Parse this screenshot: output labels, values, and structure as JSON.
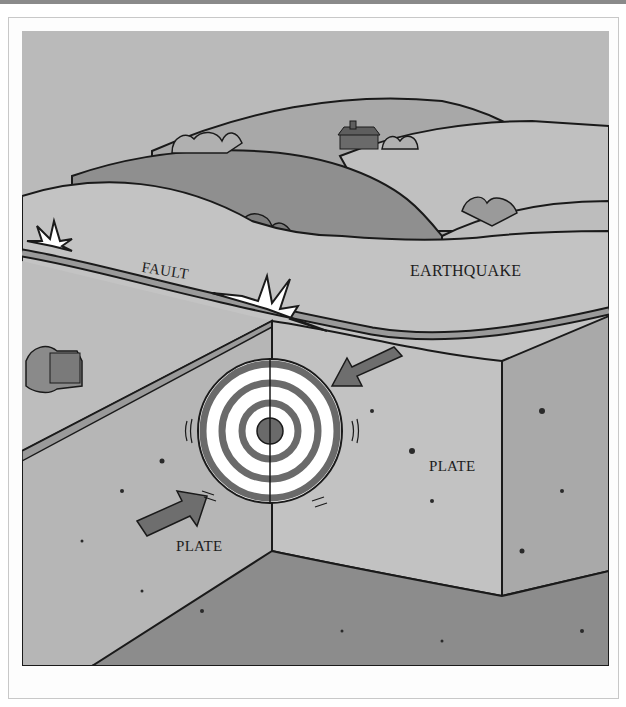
{
  "figure": {
    "labels": {
      "fault": "FAULT",
      "earthquake": "EARTHQUAKE",
      "plate_left": "PLATE",
      "plate_right": "PLATE"
    },
    "elements": [
      "rolling-hills",
      "farmhouse",
      "bushes",
      "fault-line",
      "rupture-burst-large",
      "rupture-burst-small",
      "focus-target-rings",
      "plate-motion-arrow-left",
      "plate-motion-arrow-right",
      "left-plate-block",
      "right-plate-block",
      "ground-base"
    ],
    "colors": {
      "sky": "#b9b9b9",
      "far_hills": "#a3a3a3",
      "mid_hill": "#8f8f8f",
      "surface": "#c2c2c2",
      "plate_face": "#b4b4b4",
      "ground_base": "#8c8c8c",
      "arrow": "#6e6e6e",
      "target_ring": "#6a6a6a",
      "ink": "#1a1a1a",
      "burst": "#ffffff"
    }
  }
}
